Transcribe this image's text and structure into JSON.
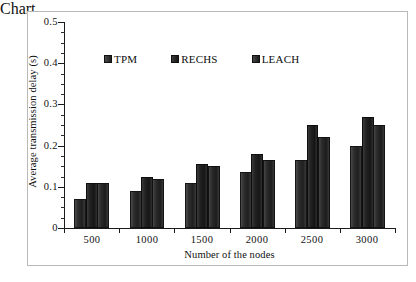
{
  "chart_data": {
    "type": "bar",
    "title": "",
    "xlabel": "Number of the nodes",
    "ylabel": "Average transmission delay (s)",
    "categories": [
      "500",
      "1000",
      "1500",
      "2000",
      "2500",
      "3000"
    ],
    "series": [
      {
        "name": "TPM",
        "values": [
          0.07,
          0.09,
          0.11,
          0.135,
          0.165,
          0.2
        ]
      },
      {
        "name": "RECHS",
        "values": [
          0.11,
          0.125,
          0.155,
          0.18,
          0.25,
          0.27
        ]
      },
      {
        "name": "LEACH",
        "values": [
          0.11,
          0.12,
          0.15,
          0.165,
          0.22,
          0.25
        ]
      }
    ],
    "ylim": [
      0,
      0.5
    ],
    "ytick_labels": [
      "0",
      "0.1",
      "0.2",
      "0.3",
      "0.4",
      "0.5"
    ],
    "ytick_values": [
      0,
      0.1,
      0.2,
      0.3,
      0.4,
      0.5
    ],
    "yminor_step": 0.025,
    "grid": false,
    "legend_position": "upper-center",
    "colors": {
      "series_0": "#2e2e2e",
      "series_1": "#1a1a1a",
      "series_2": "#282828",
      "axis": "#1a1a1a",
      "frame": "#b9b9b9",
      "background": "#ffffff"
    }
  },
  "legend": {
    "items": [
      {
        "label": "TPM"
      },
      {
        "label": "RECHS"
      },
      {
        "label": "LEACH"
      }
    ]
  },
  "axes": {
    "y_title": "Average transmission delay (s)",
    "x_title": "Number of the nodes"
  }
}
